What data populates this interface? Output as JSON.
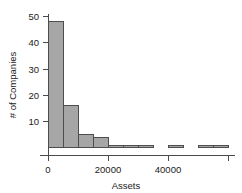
{
  "chart_data": {
    "type": "bar",
    "subtype": "histogram",
    "title": "",
    "xlabel": "Assets",
    "ylabel": "# of Companies",
    "xlim": [
      -3000,
      62000
    ],
    "ylim": [
      0,
      51
    ],
    "grid": false,
    "legend": null,
    "bin_width": 5000,
    "xticks": [
      0,
      20000,
      40000
    ],
    "xtick_labels": [
      "0",
      "20000",
      "40000"
    ],
    "xticks_unlabeled": [
      60000
    ],
    "yticks": [
      10,
      20,
      30,
      40,
      50
    ],
    "ytick_labels": [
      "10",
      "20",
      "30",
      "40",
      "50"
    ],
    "categories": [
      "0-5000",
      "5000-10000",
      "10000-15000",
      "15000-20000",
      "20000-25000",
      "25000-30000",
      "30000-35000",
      "35000-40000",
      "40000-45000",
      "45000-50000",
      "50000-55000",
      "55000-60000"
    ],
    "bin_starts": [
      0,
      5000,
      10000,
      15000,
      20000,
      25000,
      30000,
      35000,
      40000,
      45000,
      50000,
      55000
    ],
    "values": [
      48,
      16,
      5,
      4,
      1,
      1,
      1,
      0,
      1,
      0,
      1,
      1
    ],
    "bar_fill": "#a6a6a6",
    "bar_stroke": "#4d4d4d",
    "axis_color": "#4a4a4a",
    "text_color": "#1a1a1a",
    "background": "#ffffff"
  }
}
